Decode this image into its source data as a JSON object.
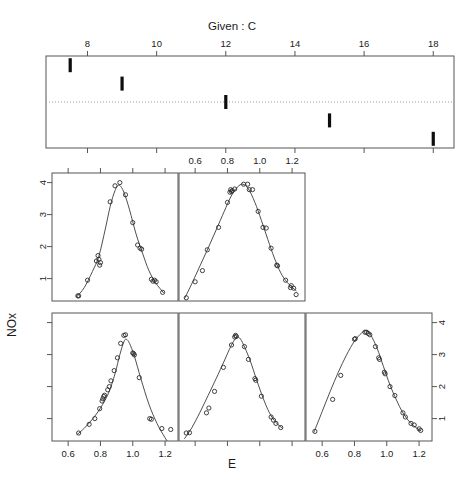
{
  "figure": {
    "type": "coplot",
    "given_title": "Given :  C",
    "xlabel": "E",
    "ylabel": "NOx"
  },
  "given_panel": {
    "axis_label": "C",
    "tick_values": [
      8,
      10,
      12,
      14,
      16,
      18
    ],
    "tick_labels": [
      "8",
      "10",
      "12",
      "14",
      "16",
      "18"
    ],
    "xlim": [
      6.8,
      18.6
    ],
    "reference_line": "dotted",
    "intervals": [
      {
        "index": 1,
        "center": 7.5,
        "row": 1
      },
      {
        "index": 2,
        "center": 9.0,
        "row": 2
      },
      {
        "index": 3,
        "center": 12.0,
        "row": 3
      },
      {
        "index": 4,
        "center": 15.0,
        "row": 4
      },
      {
        "index": 5,
        "center": 18.0,
        "row": 5
      }
    ]
  },
  "chart_data": {
    "type": "scatter",
    "title": "Given :  C",
    "xlabel": "E",
    "ylabel": "NOx",
    "xlim": [
      0.5,
      1.28
    ],
    "ylim": [
      0.3,
      4.3
    ],
    "xticks": [
      0.6,
      0.8,
      1.0,
      1.2
    ],
    "xticklabels": [
      "0.6",
      "0.8",
      "1.0",
      "1.2"
    ],
    "yticks": [
      1,
      2,
      3,
      4
    ],
    "yticklabels": [
      "1",
      "2",
      "3",
      "4"
    ],
    "grid": false,
    "legend": false,
    "conditioning_variable": "C",
    "layout": {
      "rows": 2,
      "cols": 3,
      "panels_used": 5,
      "order": "bottom-left-to-top-right"
    },
    "panels": [
      {
        "panel_id": "row2-col1",
        "row": 2,
        "col": 1,
        "given_index": 1,
        "x_axis_labeled": true,
        "y_axis_labeled": false,
        "points": [
          {
            "x": 0.665,
            "y": 0.55
          },
          {
            "x": 0.73,
            "y": 0.82
          },
          {
            "x": 0.765,
            "y": 1.0
          },
          {
            "x": 0.795,
            "y": 1.31
          },
          {
            "x": 0.81,
            "y": 1.55
          },
          {
            "x": 0.815,
            "y": 1.62
          },
          {
            "x": 0.82,
            "y": 1.69
          },
          {
            "x": 0.825,
            "y": 1.73
          },
          {
            "x": 0.845,
            "y": 1.9
          },
          {
            "x": 0.855,
            "y": 2.0
          },
          {
            "x": 0.865,
            "y": 2.18
          },
          {
            "x": 0.885,
            "y": 2.5
          },
          {
            "x": 0.905,
            "y": 2.9
          },
          {
            "x": 0.925,
            "y": 3.35
          },
          {
            "x": 0.945,
            "y": 3.6
          },
          {
            "x": 0.955,
            "y": 3.62
          },
          {
            "x": 1.0,
            "y": 3.05
          },
          {
            "x": 1.005,
            "y": 3.03
          },
          {
            "x": 1.01,
            "y": 2.99
          },
          {
            "x": 1.04,
            "y": 2.28
          },
          {
            "x": 1.105,
            "y": 1.0
          },
          {
            "x": 1.115,
            "y": 0.98
          },
          {
            "x": 1.18,
            "y": 0.69
          },
          {
            "x": 1.235,
            "y": 0.66
          }
        ],
        "fit": [
          {
            "x": 0.655,
            "y": 0.5
          },
          {
            "x": 0.7,
            "y": 0.7
          },
          {
            "x": 0.75,
            "y": 0.98
          },
          {
            "x": 0.8,
            "y": 1.33
          },
          {
            "x": 0.85,
            "y": 1.8
          },
          {
            "x": 0.89,
            "y": 2.4
          },
          {
            "x": 0.92,
            "y": 3.0
          },
          {
            "x": 0.945,
            "y": 3.4
          },
          {
            "x": 0.96,
            "y": 3.48
          },
          {
            "x": 0.98,
            "y": 3.35
          },
          {
            "x": 1.01,
            "y": 2.95
          },
          {
            "x": 1.05,
            "y": 2.25
          },
          {
            "x": 1.1,
            "y": 1.45
          },
          {
            "x": 1.15,
            "y": 0.85
          },
          {
            "x": 1.2,
            "y": 0.4
          },
          {
            "x": 1.24,
            "y": 0.1
          }
        ]
      },
      {
        "panel_id": "row2-col2",
        "row": 2,
        "col": 2,
        "given_index": 2,
        "x_axis_labeled": false,
        "y_axis_labeled": false,
        "points": [
          {
            "x": 0.545,
            "y": 0.55
          },
          {
            "x": 0.565,
            "y": 0.56
          },
          {
            "x": 0.67,
            "y": 1.18
          },
          {
            "x": 0.685,
            "y": 1.33
          },
          {
            "x": 0.72,
            "y": 1.85
          },
          {
            "x": 0.775,
            "y": 2.6
          },
          {
            "x": 0.825,
            "y": 3.3
          },
          {
            "x": 0.845,
            "y": 3.55
          },
          {
            "x": 0.85,
            "y": 3.6
          },
          {
            "x": 0.855,
            "y": 3.57
          },
          {
            "x": 0.905,
            "y": 3.25
          },
          {
            "x": 0.93,
            "y": 2.85
          },
          {
            "x": 0.97,
            "y": 2.25
          },
          {
            "x": 0.975,
            "y": 2.2
          },
          {
            "x": 1.01,
            "y": 1.7
          },
          {
            "x": 1.07,
            "y": 1.05
          },
          {
            "x": 1.085,
            "y": 0.95
          },
          {
            "x": 1.1,
            "y": 0.85
          },
          {
            "x": 1.13,
            "y": 0.72
          }
        ],
        "fit": [
          {
            "x": 0.535,
            "y": 0.38
          },
          {
            "x": 0.58,
            "y": 0.72
          },
          {
            "x": 0.63,
            "y": 1.2
          },
          {
            "x": 0.68,
            "y": 1.72
          },
          {
            "x": 0.73,
            "y": 2.25
          },
          {
            "x": 0.78,
            "y": 2.8
          },
          {
            "x": 0.82,
            "y": 3.25
          },
          {
            "x": 0.85,
            "y": 3.5
          },
          {
            "x": 0.875,
            "y": 3.52
          },
          {
            "x": 0.9,
            "y": 3.3
          },
          {
            "x": 0.94,
            "y": 2.82
          },
          {
            "x": 0.98,
            "y": 2.22
          },
          {
            "x": 1.02,
            "y": 1.65
          },
          {
            "x": 1.06,
            "y": 1.18
          },
          {
            "x": 1.1,
            "y": 0.88
          },
          {
            "x": 1.14,
            "y": 0.7
          }
        ]
      },
      {
        "panel_id": "row2-col3",
        "row": 2,
        "col": 3,
        "given_index": 3,
        "x_axis_labeled": true,
        "y_axis_labeled": true,
        "y_axis_side": "right",
        "points": [
          {
            "x": 0.555,
            "y": 0.6
          },
          {
            "x": 0.665,
            "y": 1.6
          },
          {
            "x": 0.715,
            "y": 2.35
          },
          {
            "x": 0.8,
            "y": 3.48
          },
          {
            "x": 0.805,
            "y": 3.5
          },
          {
            "x": 0.865,
            "y": 3.7
          },
          {
            "x": 0.875,
            "y": 3.7
          },
          {
            "x": 0.885,
            "y": 3.66
          },
          {
            "x": 0.895,
            "y": 3.62
          },
          {
            "x": 0.93,
            "y": 3.25
          },
          {
            "x": 0.95,
            "y": 2.9
          },
          {
            "x": 0.955,
            "y": 2.85
          },
          {
            "x": 0.985,
            "y": 2.45
          },
          {
            "x": 0.99,
            "y": 2.4
          },
          {
            "x": 1.02,
            "y": 2.0
          },
          {
            "x": 1.05,
            "y": 1.72
          },
          {
            "x": 1.1,
            "y": 1.18
          },
          {
            "x": 1.115,
            "y": 1.05
          },
          {
            "x": 1.15,
            "y": 0.85
          },
          {
            "x": 1.17,
            "y": 0.8
          },
          {
            "x": 1.2,
            "y": 0.68
          },
          {
            "x": 1.21,
            "y": 0.63
          }
        ],
        "fit": [
          {
            "x": 0.55,
            "y": 0.58
          },
          {
            "x": 0.6,
            "y": 1.22
          },
          {
            "x": 0.65,
            "y": 1.85
          },
          {
            "x": 0.7,
            "y": 2.45
          },
          {
            "x": 0.75,
            "y": 2.98
          },
          {
            "x": 0.8,
            "y": 3.42
          },
          {
            "x": 0.845,
            "y": 3.68
          },
          {
            "x": 0.875,
            "y": 3.75
          },
          {
            "x": 0.9,
            "y": 3.62
          },
          {
            "x": 0.94,
            "y": 3.2
          },
          {
            "x": 0.98,
            "y": 2.62
          },
          {
            "x": 1.02,
            "y": 2.05
          },
          {
            "x": 1.06,
            "y": 1.58
          },
          {
            "x": 1.1,
            "y": 1.18
          },
          {
            "x": 1.15,
            "y": 0.85
          },
          {
            "x": 1.21,
            "y": 0.62
          }
        ]
      },
      {
        "panel_id": "row1-col1",
        "row": 1,
        "col": 1,
        "given_index": 4,
        "x_axis_labeled": false,
        "y_axis_labeled": true,
        "y_axis_side": "left",
        "points": [
          {
            "x": 0.66,
            "y": 0.46
          },
          {
            "x": 0.665,
            "y": 0.46
          },
          {
            "x": 0.72,
            "y": 0.95
          },
          {
            "x": 0.775,
            "y": 1.55
          },
          {
            "x": 0.785,
            "y": 1.72
          },
          {
            "x": 0.79,
            "y": 1.6
          },
          {
            "x": 0.795,
            "y": 1.42
          },
          {
            "x": 0.8,
            "y": 1.5
          },
          {
            "x": 0.86,
            "y": 3.4
          },
          {
            "x": 0.89,
            "y": 3.9
          },
          {
            "x": 0.92,
            "y": 4.0
          },
          {
            "x": 0.955,
            "y": 3.62
          },
          {
            "x": 1.0,
            "y": 2.75
          },
          {
            "x": 1.03,
            "y": 2.05
          },
          {
            "x": 1.045,
            "y": 1.95
          },
          {
            "x": 1.055,
            "y": 1.92
          },
          {
            "x": 1.115,
            "y": 0.98
          },
          {
            "x": 1.125,
            "y": 0.92
          },
          {
            "x": 1.135,
            "y": 0.95
          },
          {
            "x": 1.145,
            "y": 0.9
          },
          {
            "x": 1.185,
            "y": 0.57
          }
        ],
        "fit": [
          {
            "x": 0.655,
            "y": 0.44
          },
          {
            "x": 0.7,
            "y": 0.72
          },
          {
            "x": 0.75,
            "y": 1.22
          },
          {
            "x": 0.79,
            "y": 1.7
          },
          {
            "x": 0.83,
            "y": 2.55
          },
          {
            "x": 0.86,
            "y": 3.25
          },
          {
            "x": 0.89,
            "y": 3.75
          },
          {
            "x": 0.915,
            "y": 3.92
          },
          {
            "x": 0.945,
            "y": 3.7
          },
          {
            "x": 0.98,
            "y": 3.15
          },
          {
            "x": 1.02,
            "y": 2.4
          },
          {
            "x": 1.06,
            "y": 1.8
          },
          {
            "x": 1.1,
            "y": 1.25
          },
          {
            "x": 1.14,
            "y": 0.88
          },
          {
            "x": 1.19,
            "y": 0.56
          }
        ]
      },
      {
        "panel_id": "row1-col2",
        "row": 1,
        "col": 2,
        "given_index": 5,
        "x_axis_labeled": false,
        "x_axis_labeled_top": true,
        "y_axis_labeled": false,
        "points": [
          {
            "x": 0.545,
            "y": 0.4
          },
          {
            "x": 0.6,
            "y": 0.9
          },
          {
            "x": 0.645,
            "y": 1.25
          },
          {
            "x": 0.675,
            "y": 1.9
          },
          {
            "x": 0.745,
            "y": 2.6
          },
          {
            "x": 0.8,
            "y": 3.38
          },
          {
            "x": 0.815,
            "y": 3.7
          },
          {
            "x": 0.82,
            "y": 3.78
          },
          {
            "x": 0.825,
            "y": 3.72
          },
          {
            "x": 0.83,
            "y": 3.75
          },
          {
            "x": 0.845,
            "y": 3.8
          },
          {
            "x": 0.9,
            "y": 3.95
          },
          {
            "x": 0.925,
            "y": 3.95
          },
          {
            "x": 0.935,
            "y": 3.78
          },
          {
            "x": 0.955,
            "y": 3.78
          },
          {
            "x": 0.99,
            "y": 3.1
          },
          {
            "x": 1.02,
            "y": 2.6
          },
          {
            "x": 1.04,
            "y": 2.58
          },
          {
            "x": 1.07,
            "y": 1.95
          },
          {
            "x": 1.105,
            "y": 1.42
          },
          {
            "x": 1.11,
            "y": 1.4
          },
          {
            "x": 1.16,
            "y": 0.95
          },
          {
            "x": 1.19,
            "y": 0.72
          },
          {
            "x": 1.195,
            "y": 0.78
          },
          {
            "x": 1.21,
            "y": 0.7
          },
          {
            "x": 1.225,
            "y": 0.5
          }
        ],
        "fit": [
          {
            "x": 0.535,
            "y": 0.38
          },
          {
            "x": 0.58,
            "y": 0.85
          },
          {
            "x": 0.63,
            "y": 1.4
          },
          {
            "x": 0.68,
            "y": 1.95
          },
          {
            "x": 0.73,
            "y": 2.52
          },
          {
            "x": 0.78,
            "y": 3.1
          },
          {
            "x": 0.82,
            "y": 3.55
          },
          {
            "x": 0.86,
            "y": 3.85
          },
          {
            "x": 0.895,
            "y": 3.95
          },
          {
            "x": 0.93,
            "y": 3.8
          },
          {
            "x": 0.97,
            "y": 3.38
          },
          {
            "x": 1.01,
            "y": 2.82
          },
          {
            "x": 1.05,
            "y": 2.22
          },
          {
            "x": 1.09,
            "y": 1.65
          },
          {
            "x": 1.13,
            "y": 1.18
          },
          {
            "x": 1.17,
            "y": 0.88
          },
          {
            "x": 1.225,
            "y": 0.62
          }
        ]
      }
    ]
  }
}
